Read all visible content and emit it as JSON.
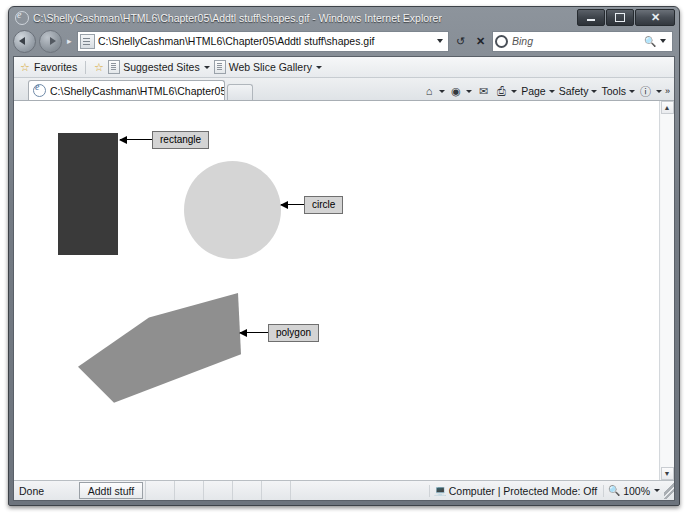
{
  "window": {
    "title": "C:\\ShellyCashman\\HTML6\\Chapter05\\Addtl stuff\\shapes.gif - Windows Internet Explorer",
    "minimize_label": "Minimize",
    "maximize_label": "Restore",
    "close_label": "Close"
  },
  "navbar": {
    "back_label": "Back",
    "forward_label": "Forward",
    "address_value": "C:\\ShellyCashman\\HTML6\\Chapter05\\Addtl stuff\\shapes.gif",
    "address_dropdown": "▼",
    "refresh_label": "↺",
    "stop_label": "✕",
    "search_value": "Bing",
    "search_icon": "search-magnifier-icon",
    "search_dropdown": "▼"
  },
  "favorites_bar": {
    "favorites_label": "Favorites",
    "items": [
      {
        "label": "Suggested Sites",
        "caret": "▼"
      },
      {
        "label": "Web Slice Gallery",
        "caret": "▼"
      }
    ]
  },
  "tabs": {
    "active_label": "C:\\ShellyCashman\\HTML6\\Chapter05\\Addtl stuf...",
    "new_tab_label": ""
  },
  "command_bar": {
    "home_icon": "⌂",
    "feeds_icon": "◉",
    "mail_icon": "✉",
    "print_icon": "⎙",
    "items": [
      {
        "label": "Page",
        "caret": "▾"
      },
      {
        "label": "Safety",
        "caret": "▾"
      },
      {
        "label": "Tools",
        "caret": "▾"
      }
    ],
    "help_icon": "?",
    "overflow": "»"
  },
  "page": {
    "shapes": [
      {
        "name": "rectangle",
        "color": "#3a3a3a",
        "label": "rectangle"
      },
      {
        "name": "circle",
        "color": "#d5d5d5",
        "label": "circle"
      },
      {
        "name": "polygon",
        "color": "#8f8f8f",
        "label": "polygon"
      }
    ],
    "polygon_points": "71,45 0,135 36,201 163,112 160,0"
  },
  "scrollbar": {
    "up_arrow": "▲",
    "down_arrow": "▼"
  },
  "status_bar": {
    "status_text": "Done",
    "taskbar_button": "Addtl stuff",
    "zone_text": "Computer | Protected Mode: Off",
    "zone_caret": "▾",
    "zoom_level": "100%",
    "zoom_caret": "▾"
  }
}
